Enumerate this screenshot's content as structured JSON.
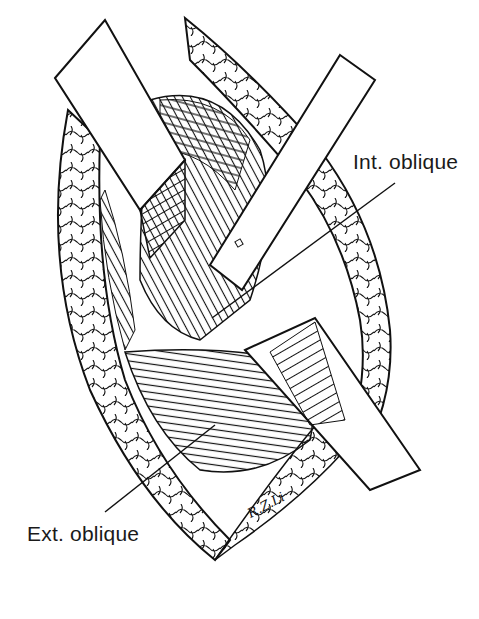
{
  "figure": {
    "type": "surgical line illustration",
    "colors": {
      "ink": "#111111",
      "paper": "#ffffff"
    }
  },
  "labels": {
    "internal": "Int. oblique",
    "external": "Ext. oblique"
  },
  "signature": "R.Z.Li"
}
